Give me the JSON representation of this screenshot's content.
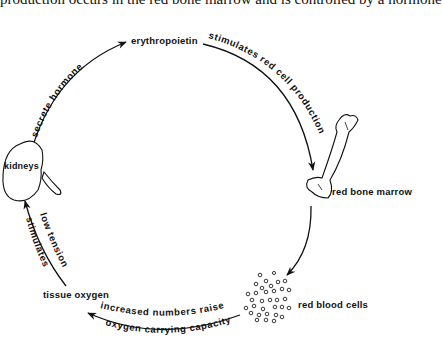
{
  "caption": "production occurs in the red bone marrow and is controlled by a hormone",
  "nodes": {
    "erythropoietin": "erythropoietin",
    "red_bone_marrow": "red bone marrow",
    "red_blood_cells": "red blood cells",
    "tissue_oxygen": "tissue oxygen",
    "kidneys": "kidneys"
  },
  "edges": {
    "kidneys_to_erythropoietin": "secrete hormone",
    "erythropoietin_to_marrow": "stimulates red cell production",
    "cells_to_oxygen_line1": "increased numbers raise",
    "cells_to_oxygen_line2": "oxygen carrying capacity",
    "oxygen_to_kidneys_line1": "low tension",
    "oxygen_to_kidneys_line2": "stimulates"
  }
}
